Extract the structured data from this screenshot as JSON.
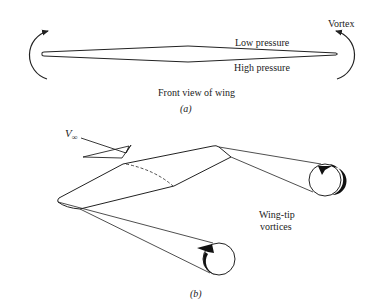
{
  "panel_a": {
    "caption": "(a)",
    "title": "Front view of wing",
    "labels": {
      "vortex": "Vortex",
      "low_pressure": "Low pressure",
      "high_pressure": "High pressure"
    }
  },
  "panel_b": {
    "caption": "(b)",
    "freestream_label": "V",
    "freestream_subscript": "∞",
    "vortices_label_line1": "Wing-tip",
    "vortices_label_line2": "vortices"
  },
  "colors": {
    "line": "#222222",
    "background": "#ffffff"
  }
}
